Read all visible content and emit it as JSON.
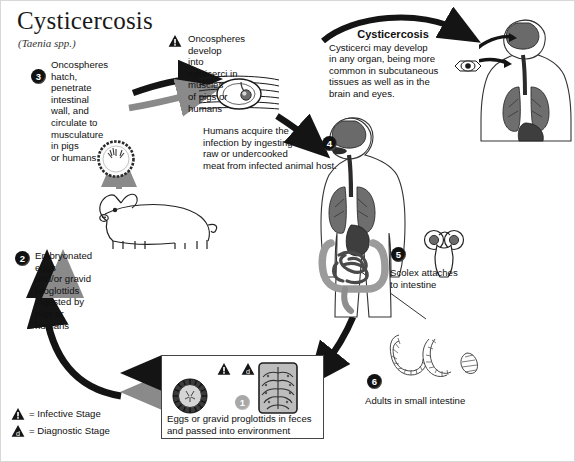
{
  "title": "Cysticercosis",
  "subtitle": "(Taenia spp.)",
  "steps": {
    "s1": {
      "num": "1",
      "text": "Eggs or gravid proglottids in feces\nand passed into environment"
    },
    "s2": {
      "num": "2",
      "text": "Embryonated eggs\nand/or gravid proglottids\ningested by pigs or humans"
    },
    "s3": {
      "num": "3",
      "text": "Oncospheres hatch,\npenetrate intestinal\nwall, and circulate to\nmusculature in pigs\nor humans"
    },
    "s4": {
      "num": "4",
      "text": "Humans acquire the\ninfection by ingesting\nraw or undercooked\nmeat from infected animal host."
    },
    "s5": {
      "num": "5",
      "text": "Scolex attaches\nto intestine"
    },
    "s6": {
      "num": "6",
      "text": "Adults in small intestine"
    }
  },
  "annotations": {
    "oncospheres_develop": "Oncospheres develop\ninto cysticerci in muscles\nof pigs or humans",
    "cysticercosis_heading": "Cysticercosis",
    "cysticercosis_body": "Cysticerci may develop\nin any organ, being more\ncommon in subcutaneous\ntissues as well as in the\nbrain and eyes."
  },
  "legend": {
    "infective": {
      "marker": "!",
      "label": "= Infective Stage"
    },
    "diagnostic": {
      "marker": "d",
      "label": "= Diagnostic Stage"
    }
  },
  "figures": {
    "cysticercus_in_muscle": "cysticercus-in-muscle-icon",
    "oncosphere": "oncosphere-icon",
    "pig": "pig-icon",
    "human_digestive": "human-digestive-system-icon",
    "human_brain_eye": "human-brain-and-eye-icon",
    "eye_closeup": "eye-closeup-icon",
    "scolex": "scolex-icon",
    "adult_tapeworm": "adult-tapeworm-icon",
    "egg": "taenia-egg-icon",
    "proglottid": "gravid-proglottid-icon"
  },
  "colors": {
    "arrow_black": "#141414",
    "arrow_grey": "#8a8a8a",
    "organ_dark": "#4a4a4a",
    "organ_mid": "#6e6e6e",
    "organ_light": "#9b9b9b",
    "ink": "#101010"
  }
}
